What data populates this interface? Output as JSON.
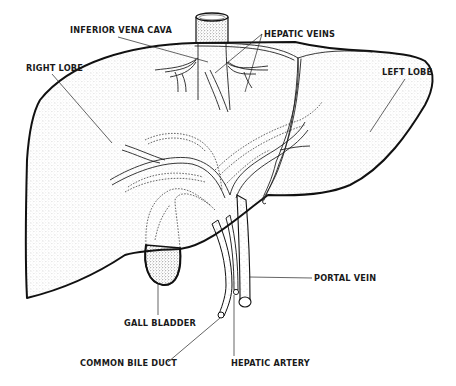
{
  "diagram": {
    "labels": [
      {
        "id": "inferior-vena-cava",
        "text": "INFERIOR VENA CAVA",
        "x": 70,
        "y": 33
      },
      {
        "id": "hepatic-veins",
        "text": "HEPATIC VEINS",
        "x": 262,
        "y": 37
      },
      {
        "id": "right-lobe",
        "text": "RIGHT LOBE",
        "x": 26,
        "y": 71
      },
      {
        "id": "left-lobe",
        "text": "LEFT LOBE",
        "x": 382,
        "y": 75
      },
      {
        "id": "portal-vein",
        "text": "PORTAL VEIN",
        "x": 313,
        "y": 281
      },
      {
        "id": "gall-bladder",
        "text": "GALL BLADDER",
        "x": 123,
        "y": 326
      },
      {
        "id": "common-bile-duct",
        "text": "COMMON BILE DUCT",
        "x": 80,
        "y": 366
      },
      {
        "id": "hepatic-artery",
        "text": "HEPATIC ARTERY",
        "x": 231,
        "y": 366
      }
    ],
    "colors": {
      "ink": "#111111",
      "background": "#ffffff"
    }
  }
}
